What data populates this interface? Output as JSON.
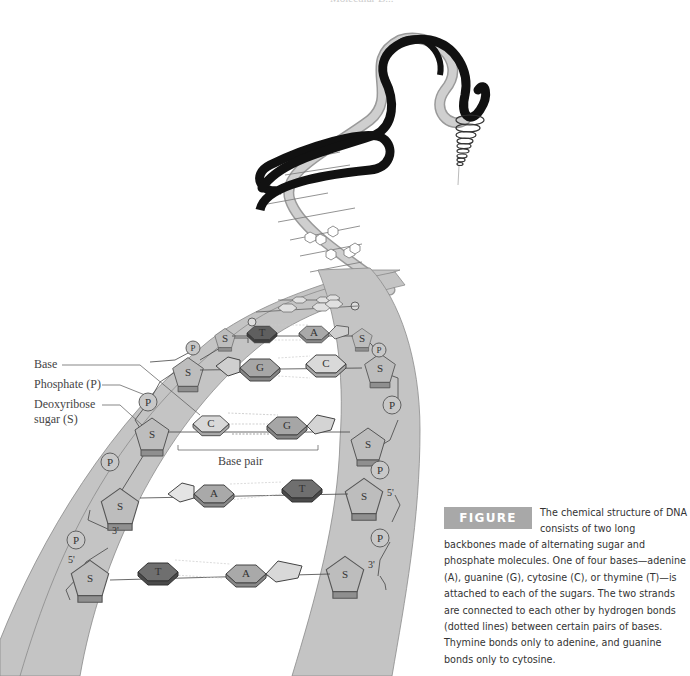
{
  "header": {
    "text": "Molecular B..."
  },
  "labels": {
    "base": "Base",
    "phosphate": "Phosphate (P)",
    "deoxyribose_line1": "Deoxyribose",
    "deoxyribose_line2": "sugar (S)",
    "base_pair": "Base pair"
  },
  "molecules": {
    "sugar": "S",
    "phosphate": "P",
    "pairs": [
      {
        "left": "T",
        "right": "A"
      },
      {
        "left": "G",
        "right": "C"
      },
      {
        "left": "C",
        "right": "G"
      },
      {
        "left": "A",
        "right": "T"
      },
      {
        "left": "T",
        "right": "A"
      }
    ],
    "prime_labels": {
      "left_3": "3'",
      "left_5": "5'",
      "right_5": "5'",
      "right_3": "3'"
    }
  },
  "caption": {
    "figure_label": "FIGURE 2.16",
    "first_line": "The chemical structure of DNA consists of two long",
    "body": "backbones made of alternating sugar and phosphate molecules. One of four bases—adenine (A), guanine (G), cytosine (C), or thymine (T)—is attached to each of the sugars. The two strands are connected to each other by hydrogen bonds (dotted lines) between certain pairs of bases. Thymine bonds only to adenine, and guanine bonds only to cytosine."
  },
  "colors": {
    "backbone": "#c4c4c4",
    "backbone_stroke": "#8a8a8a",
    "helix_dark": "#111111",
    "helix_light": "#bdbdbd",
    "thymine": "#6f6f6f",
    "adenine": "#a9a9a9",
    "guanine": "#a6a6a6",
    "cytosine": "#d9d9d9",
    "badge": "#a8a8a8"
  }
}
